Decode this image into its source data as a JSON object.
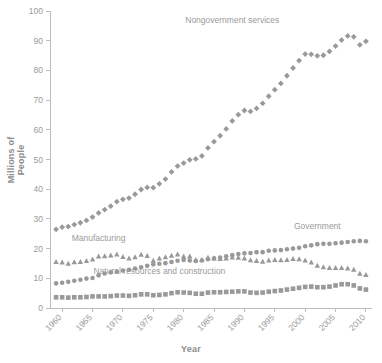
{
  "chart_data": {
    "type": "line",
    "title": "",
    "xlabel": "Year",
    "ylabel": "Millions of People",
    "xlim": [
      1958,
      2011
    ],
    "ylim": [
      0,
      100
    ],
    "ytick_labels": [
      "0",
      "10",
      "20",
      "30",
      "40",
      "50",
      "60",
      "70",
      "80",
      "90",
      "100"
    ],
    "yticks": [
      0,
      10,
      20,
      30,
      40,
      50,
      60,
      70,
      80,
      90,
      100
    ],
    "xtick_labels": [
      "1960",
      "1965",
      "1970",
      "1975",
      "1980",
      "1985",
      "1990",
      "1995",
      "2000",
      "2005",
      "2010"
    ],
    "xticks": [
      1960,
      1965,
      1970,
      1975,
      1980,
      1985,
      1990,
      1995,
      2000,
      2005,
      2010
    ],
    "grid": false,
    "legend_position": "inline-annotations",
    "x": [
      1959,
      1960,
      1961,
      1962,
      1963,
      1964,
      1965,
      1966,
      1967,
      1968,
      1969,
      1970,
      1971,
      1972,
      1973,
      1974,
      1975,
      1976,
      1977,
      1978,
      1979,
      1980,
      1981,
      1982,
      1983,
      1984,
      1985,
      1986,
      1987,
      1988,
      1989,
      1990,
      1991,
      1992,
      1993,
      1994,
      1995,
      1996,
      1997,
      1998,
      1999,
      2000,
      2001,
      2002,
      2003,
      2004,
      2005,
      2006,
      2007,
      2008,
      2009,
      2010
    ],
    "series": [
      {
        "name": "Nongovernment services",
        "marker": "diamond",
        "color": "#999999",
        "label_x": 1988,
        "label_y": 96,
        "values": [
          26.5,
          27.2,
          27.4,
          28.1,
          28.7,
          29.5,
          30.6,
          32.0,
          33.1,
          34.3,
          35.8,
          36.6,
          37.0,
          38.3,
          39.9,
          40.6,
          40.5,
          41.8,
          43.4,
          45.8,
          47.8,
          48.8,
          49.9,
          50.2,
          51.2,
          53.9,
          56.0,
          58.0,
          60.3,
          63.0,
          65.1,
          66.5,
          66.2,
          67.2,
          68.9,
          71.3,
          73.5,
          75.6,
          78.2,
          80.8,
          83.3,
          85.5,
          85.4,
          84.9,
          85.1,
          86.4,
          88.2,
          90.2,
          91.6,
          91.3,
          88.6,
          89.8
        ]
      },
      {
        "name": "Government",
        "marker": "circle",
        "color": "#999999",
        "label_x": 2002,
        "label_y": 26.5,
        "values": [
          8.3,
          8.5,
          8.8,
          9.2,
          9.5,
          9.9,
          10.1,
          11.0,
          11.6,
          12.0,
          12.2,
          12.6,
          12.9,
          13.3,
          13.7,
          14.2,
          14.7,
          14.9,
          15.1,
          15.5,
          15.9,
          16.2,
          16.0,
          15.8,
          16.0,
          16.4,
          16.7,
          17.0,
          17.4,
          17.8,
          18.2,
          18.4,
          18.5,
          18.8,
          18.8,
          19.3,
          19.4,
          19.5,
          19.8,
          20.0,
          20.3,
          20.8,
          21.1,
          21.5,
          21.6,
          21.6,
          21.8,
          22.0,
          22.2,
          22.5,
          22.6,
          22.5
        ]
      },
      {
        "name": "Manufacturing",
        "marker": "triangle",
        "color": "#999999",
        "label_x": 1966,
        "label_y": 22.5,
        "values": [
          15.6,
          15.4,
          15.0,
          15.5,
          15.6,
          15.9,
          16.4,
          17.4,
          17.5,
          17.8,
          18.1,
          17.3,
          16.8,
          17.2,
          18.0,
          17.6,
          16.0,
          16.8,
          17.2,
          17.7,
          18.1,
          17.4,
          17.4,
          16.3,
          16.3,
          17.0,
          16.8,
          16.6,
          16.8,
          17.1,
          17.0,
          16.8,
          16.2,
          15.9,
          15.7,
          16.1,
          16.3,
          16.2,
          16.3,
          16.6,
          16.5,
          16.1,
          15.4,
          14.3,
          13.8,
          13.6,
          13.6,
          13.6,
          13.4,
          13.0,
          11.6,
          11.2
        ]
      },
      {
        "name": "Natural resources and construction",
        "marker": "square",
        "color": "#999999",
        "label_x": 1976,
        "label_y": 11.5,
        "values": [
          3.6,
          3.6,
          3.5,
          3.6,
          3.6,
          3.7,
          3.9,
          3.9,
          3.9,
          4.0,
          4.2,
          4.2,
          4.1,
          4.3,
          4.6,
          4.6,
          4.3,
          4.4,
          4.6,
          5.0,
          5.3,
          5.2,
          5.1,
          4.8,
          4.8,
          5.2,
          5.3,
          5.3,
          5.4,
          5.5,
          5.6,
          5.6,
          5.2,
          5.1,
          5.2,
          5.5,
          5.7,
          5.9,
          6.2,
          6.5,
          6.8,
          7.1,
          7.2,
          7.0,
          7.0,
          7.2,
          7.6,
          8.0,
          8.0,
          7.6,
          6.6,
          6.2
        ]
      }
    ]
  },
  "annotations": {
    "nongovernment_services": "Nongovernment services",
    "government": "Government",
    "manufacturing": "Manufacturing",
    "natural_resources": "Natural resources and construction"
  },
  "axes": {
    "y_title": "Millions of People",
    "x_title": "Year"
  }
}
